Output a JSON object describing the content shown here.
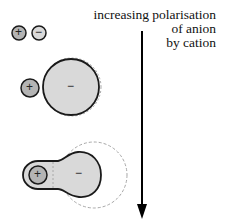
{
  "annotation": {
    "lines": [
      "increasing polarisation",
      "of anion",
      "by cation"
    ],
    "arrow_direction": "down"
  },
  "rows": [
    {
      "id": "unpolarised",
      "cation_sign": "+",
      "anion_sign": "−",
      "description": "separate small cation and anion"
    },
    {
      "id": "slightly-polarised",
      "cation_sign": "+",
      "anion_sign": "−",
      "description": "small cation next to large anion"
    },
    {
      "id": "strongly-polarised",
      "cation_sign": "+",
      "anion_sign": "−",
      "description": "anion electron cloud distorted toward cation"
    }
  ],
  "colors": {
    "cation_fill": "#b4b4b4",
    "anion_fill": "#d9d9d9",
    "outline": "#1a1a1a",
    "dashed_outline": "#a8a8a8",
    "arrow": "#000000"
  }
}
